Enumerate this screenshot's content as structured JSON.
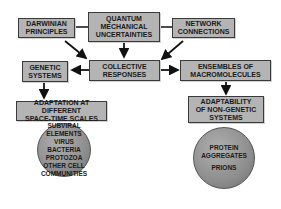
{
  "diagram": {
    "nodes": {
      "darwinian": "DARWINIAN\nPRINCIPLES",
      "quantum": "QUANTUM\nMECHANICAL\nUNCERTAINTIES",
      "network": "NETWORK\nCONNECTIONS",
      "genetic": "GENETIC\nSYSTEMS",
      "collective": "COLLECTIVE\nRESPONSES",
      "ensembles": "ENSEMBLES OF\nMACROMOLECULES",
      "adaptation": "ADAPTATION AT DIFFERENT\nSPACE-TIME SCALES",
      "adaptability": "ADAPTABILITY\nOF NON-GENETIC\nSYSTEMS"
    },
    "left_circle": [
      "SUBVIRAL\nELEMENTS",
      "VIRUS",
      "BACTERIA",
      "PROTOZOA",
      "OTHER CELL\nCOMMUNITIES"
    ],
    "right_circle": [
      "PROTEIN\nAGGREGATES",
      "PRIONS"
    ],
    "colors": {
      "box_fill": "#b4b4b4",
      "circle_fill": "#8e8e8e",
      "line": "#111111"
    }
  }
}
